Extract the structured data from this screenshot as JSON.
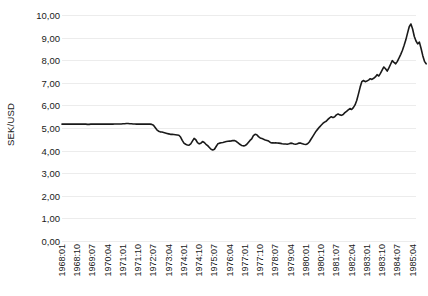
{
  "chart_data": {
    "type": "line",
    "title": "",
    "xlabel": "",
    "ylabel": "SEK/USD",
    "ylim": [
      0,
      10
    ],
    "ytick_labels": [
      "0,00",
      "1,00",
      "2,00",
      "3,00",
      "4,00",
      "5,00",
      "6,00",
      "7,00",
      "8,00",
      "9,00",
      "10,00"
    ],
    "ytick_values": [
      0,
      1,
      2,
      3,
      4,
      5,
      6,
      7,
      8,
      9,
      10
    ],
    "grid": true,
    "legend": false,
    "line_color": "#1a1a1a",
    "gridline_color": "#ececec",
    "background_color": "#ffffff",
    "xtick_labels": [
      "1968:01",
      "1968:10",
      "1969:07",
      "1970:04",
      "1971:01",
      "1971:10",
      "1972:07",
      "1973:04",
      "1974:01",
      "1974:10",
      "1975:07",
      "1976:04",
      "1977:01",
      "1977:10",
      "1978:07",
      "1979:04",
      "1980:01",
      "1980:10",
      "1981:07",
      "1982:04",
      "1983:01",
      "1983:10",
      "1984:07",
      "1985:04"
    ],
    "xtick_indices": [
      0,
      9,
      18,
      27,
      36,
      45,
      54,
      63,
      72,
      81,
      90,
      99,
      108,
      117,
      126,
      135,
      144,
      153,
      162,
      171,
      180,
      189,
      198,
      207
    ],
    "x_start_label": "1968:01",
    "x_end_label": "1985:06",
    "n_points": 210,
    "values": [
      5.17,
      5.17,
      5.17,
      5.17,
      5.17,
      5.17,
      5.17,
      5.17,
      5.17,
      5.17,
      5.17,
      5.17,
      5.17,
      5.17,
      5.17,
      5.16,
      5.16,
      5.17,
      5.18,
      5.17,
      5.17,
      5.17,
      5.17,
      5.17,
      5.17,
      5.17,
      5.17,
      5.17,
      5.17,
      5.17,
      5.17,
      5.18,
      5.18,
      5.18,
      5.18,
      5.18,
      5.19,
      5.19,
      5.2,
      5.2,
      5.19,
      5.19,
      5.18,
      5.18,
      5.17,
      5.17,
      5.17,
      5.17,
      5.17,
      5.17,
      5.17,
      5.17,
      5.17,
      5.16,
      5.12,
      5.02,
      4.92,
      4.86,
      4.83,
      4.82,
      4.8,
      4.78,
      4.76,
      4.74,
      4.72,
      4.72,
      4.71,
      4.7,
      4.69,
      4.68,
      4.6,
      4.45,
      4.33,
      4.28,
      4.25,
      4.24,
      4.3,
      4.42,
      4.54,
      4.48,
      4.35,
      4.3,
      4.33,
      4.4,
      4.36,
      4.28,
      4.22,
      4.14,
      4.06,
      4.03,
      4.06,
      4.18,
      4.3,
      4.33,
      4.35,
      4.36,
      4.38,
      4.4,
      4.41,
      4.42,
      4.43,
      4.45,
      4.44,
      4.4,
      4.34,
      4.28,
      4.23,
      4.21,
      4.22,
      4.27,
      4.36,
      4.45,
      4.52,
      4.66,
      4.72,
      4.7,
      4.62,
      4.56,
      4.54,
      4.5,
      4.47,
      4.45,
      4.42,
      4.36,
      4.34,
      4.34,
      4.35,
      4.34,
      4.33,
      4.32,
      4.3,
      4.29,
      4.29,
      4.28,
      4.3,
      4.33,
      4.32,
      4.29,
      4.28,
      4.3,
      4.34,
      4.33,
      4.3,
      4.28,
      4.27,
      4.3,
      4.38,
      4.5,
      4.62,
      4.74,
      4.86,
      4.95,
      5.04,
      5.12,
      5.2,
      5.26,
      5.3,
      5.38,
      5.45,
      5.5,
      5.46,
      5.5,
      5.58,
      5.62,
      5.58,
      5.56,
      5.6,
      5.68,
      5.74,
      5.8,
      5.86,
      5.82,
      5.9,
      6.02,
      6.22,
      6.5,
      6.8,
      7.05,
      7.1,
      7.05,
      7.08,
      7.12,
      7.18,
      7.15,
      7.2,
      7.26,
      7.36,
      7.3,
      7.42,
      7.56,
      7.7,
      7.62,
      7.52,
      7.66,
      7.82,
      7.98,
      7.9,
      7.84,
      7.95,
      8.1,
      8.26,
      8.44,
      8.66,
      8.9,
      9.2,
      9.48,
      9.6,
      9.38,
      9.05,
      8.85,
      8.72,
      8.8,
      8.52,
      8.2,
      7.95,
      7.84
    ]
  }
}
